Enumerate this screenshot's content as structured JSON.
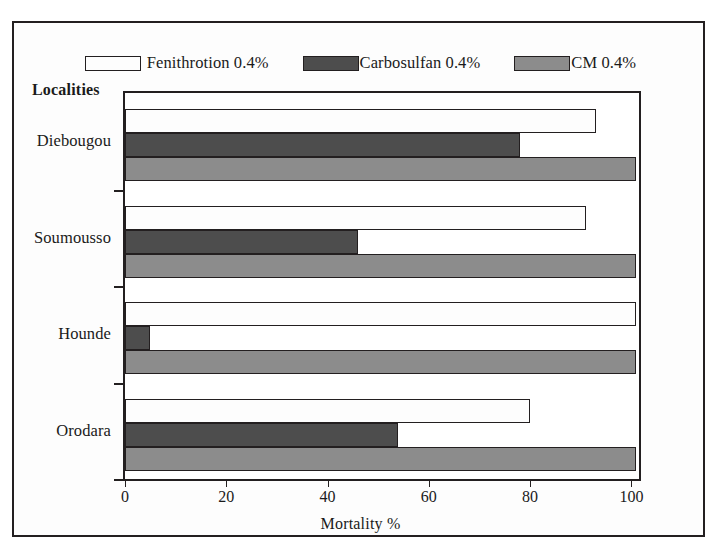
{
  "chart_data": {
    "type": "bar",
    "orientation": "horizontal",
    "title": "",
    "xlabel": "Mortality %",
    "ylabel": "Localities",
    "categories": [
      "Diebougou",
      "Soumousso",
      "Hounde",
      "Orodara"
    ],
    "series": [
      {
        "name": "Fenithrotion 0.4%",
        "color": "#fdfdfd",
        "values": [
          93,
          91,
          101,
          80
        ]
      },
      {
        "name": "Carbosulfan 0.4%",
        "color": "#4d4d4d",
        "values": [
          78,
          46,
          5,
          54
        ]
      },
      {
        "name": "CM 0.4%",
        "color": "#8c8c8c",
        "values": [
          101,
          101,
          101,
          101
        ]
      }
    ],
    "xlim": [
      0,
      101.5
    ],
    "xticks": [
      0,
      20,
      40,
      60,
      80,
      100
    ],
    "xtick_labels": [
      "0",
      "20",
      "40",
      "60",
      "80",
      "100"
    ],
    "grid": false,
    "legend_position": "top"
  },
  "legend": {
    "entries": [
      {
        "label": "Fenithrotion 0.4%",
        "color": "#fdfdfd"
      },
      {
        "label": "Carbosulfan 0.4%",
        "color": "#4d4d4d"
      },
      {
        "label": "CM 0.4%",
        "color": "#8c8c8c"
      }
    ]
  },
  "axes": {
    "y_title": "Localities",
    "x_title": "Mortality %",
    "y_categories": [
      "Diebougou",
      "Soumousso",
      "Hounde",
      "Orodara"
    ],
    "x_tick_labels": [
      "0",
      "20",
      "40",
      "60",
      "80",
      "100"
    ]
  },
  "colors": {
    "frame": "#231f20",
    "fenithrotion": "#fdfdfd",
    "carbosulfan": "#4d4d4d",
    "cm": "#8c8c8c",
    "background": "#ffffff"
  }
}
